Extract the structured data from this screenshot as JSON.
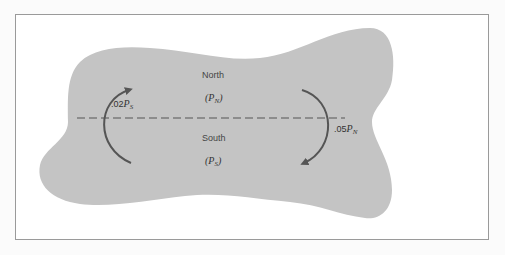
{
  "diagram": {
    "regions": {
      "north": {
        "name": "North",
        "population_symbol": "P",
        "population_subscript": "N"
      },
      "south": {
        "name": "South",
        "population_symbol": "P",
        "population_subscript": "S"
      }
    },
    "flows": {
      "south_to_north": {
        "coefficient": ".02",
        "symbol": "P",
        "subscript": "S",
        "direction": "up"
      },
      "north_to_south": {
        "coefficient": ".05",
        "symbol": "P",
        "subscript": "N",
        "direction": "down"
      }
    },
    "colors": {
      "region_fill": "#c4c4c4",
      "arrow": "#555555",
      "divider": "#555555",
      "frame": "#9a9a9a"
    }
  }
}
